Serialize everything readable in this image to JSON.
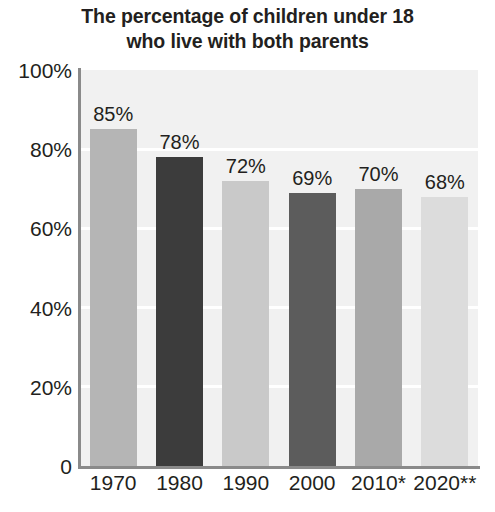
{
  "chart_data": {
    "type": "bar",
    "title": "The percentage of children under 18\nwho live with both parents",
    "title_line1": "The percentage of children under 18",
    "title_line2": "who live with both parents",
    "xlabel": "",
    "ylabel": "",
    "ylim": [
      0,
      100
    ],
    "grid": true,
    "legend": "none",
    "categories": [
      "1970",
      "1980",
      "1990",
      "2000",
      "2010*",
      "2020**"
    ],
    "values": [
      85,
      78,
      72,
      69,
      70,
      68
    ],
    "data_labels": [
      "85%",
      "78%",
      "72%",
      "69%",
      "70%",
      "68%"
    ],
    "ytick_labels": [
      "100%",
      "80%",
      "60%",
      "40%",
      "20%",
      "0"
    ],
    "ytick_values": [
      100,
      80,
      60,
      40,
      20,
      0
    ],
    "bar_colors": [
      "#b5b5b5",
      "#3c3c3c",
      "#c9c9c9",
      "#5c5c5c",
      "#a9a9a9",
      "#dcdcdc"
    ],
    "plot_background": "#f1f1f1",
    "gridline_color": "#ffffff",
    "axis_color": "#8a8a8a",
    "text_color": "#231f20",
    "points": [
      {
        "category": "1970",
        "value": 85,
        "label": "85%",
        "color": "#b5b5b5"
      },
      {
        "category": "1980",
        "value": 78,
        "label": "78%",
        "color": "#3c3c3c"
      },
      {
        "category": "1990",
        "value": 72,
        "label": "72%",
        "color": "#c9c9c9"
      },
      {
        "category": "2000",
        "value": 69,
        "label": "69%",
        "color": "#5c5c5c"
      },
      {
        "category": "2010*",
        "value": 70,
        "label": "70%",
        "color": "#a9a9a9"
      },
      {
        "category": "2020**",
        "value": 68,
        "label": "68%",
        "color": "#dcdcdc"
      }
    ]
  }
}
